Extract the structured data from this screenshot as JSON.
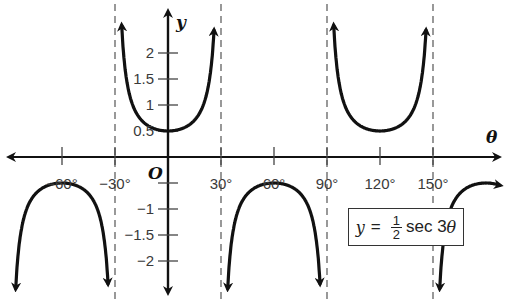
{
  "chart_data": {
    "type": "line",
    "title": "",
    "equation": {
      "lhs": "y",
      "equals": "=",
      "frac_num": "1",
      "frac_den": "2",
      "func": "sec 3",
      "var": "θ"
    },
    "xlabel": "θ",
    "ylabel": "y",
    "origin_label": "O",
    "x_ticks": [
      {
        "value": -60,
        "label": "−60°"
      },
      {
        "value": -30,
        "label": "−30°"
      },
      {
        "value": 30,
        "label": "30°"
      },
      {
        "value": 60,
        "label": "60°"
      },
      {
        "value": 90,
        "label": "90°"
      },
      {
        "value": 120,
        "label": "120°"
      },
      {
        "value": 150,
        "label": "150°"
      }
    ],
    "y_ticks": [
      {
        "value": 2,
        "label": "2"
      },
      {
        "value": 1.5,
        "label": "1.5"
      },
      {
        "value": 1,
        "label": "1"
      },
      {
        "value": 0.5,
        "label": "0.5"
      },
      {
        "value": -1,
        "label": "−1"
      },
      {
        "value": -1.5,
        "label": "−1.5"
      },
      {
        "value": -2,
        "label": "−2"
      }
    ],
    "asymptotes_deg": [
      -30,
      30,
      90,
      150
    ],
    "xlim": [
      -90,
      180
    ],
    "ylim": [
      -2.6,
      2.6
    ],
    "grid": false,
    "series": [
      {
        "name": "y = 1/2 sec 3θ",
        "branches": [
          {
            "from": -90,
            "to": -30,
            "vertex": [
              -60,
              -0.5
            ],
            "direction": "down"
          },
          {
            "from": -30,
            "to": 30,
            "vertex": [
              0,
              0.5
            ],
            "direction": "up"
          },
          {
            "from": 30,
            "to": 90,
            "vertex": [
              60,
              -0.5
            ],
            "direction": "down"
          },
          {
            "from": 90,
            "to": 150,
            "vertex": [
              120,
              0.5
            ],
            "direction": "up"
          },
          {
            "from": 150,
            "to": 210,
            "vertex": [
              180,
              -0.5
            ],
            "direction": "down"
          }
        ]
      }
    ]
  }
}
